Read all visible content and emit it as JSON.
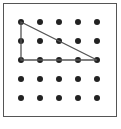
{
  "diagram": {
    "title": "",
    "type": "geoboard",
    "grid": {
      "rows": 5,
      "cols": 5,
      "origin_px": [
        21,
        22
      ],
      "spacing_px": 19
    },
    "dot_color": "#222222",
    "line_color": "#555555",
    "frame_color": "#555555",
    "shape": {
      "kind": "right-triangle",
      "vertices_grid": [
        [
          0,
          0
        ],
        [
          0,
          2
        ],
        [
          4,
          2
        ]
      ]
    }
  }
}
